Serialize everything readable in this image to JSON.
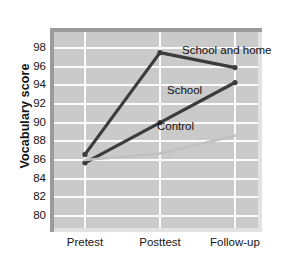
{
  "chart_data": {
    "type": "line",
    "title": "",
    "xlabel": "",
    "ylabel": "Vocabulary score",
    "categories": [
      "Pretest",
      "Posttest",
      "Follow-up"
    ],
    "ylim": [
      79,
      99
    ],
    "yticks": [
      98,
      96,
      94,
      92,
      90,
      88,
      86,
      84,
      82,
      80
    ],
    "grid": true,
    "legend_position": "inline-labels",
    "series": [
      {
        "name": "School and home",
        "values": [
          86.6,
          97.5,
          95.9
        ],
        "color": "#3c3c3c",
        "width": 3.2,
        "markers": true
      },
      {
        "name": "School",
        "values": [
          85.7,
          90.0,
          94.3
        ],
        "color": "#3c3c3c",
        "width": 3.2,
        "markers": true
      },
      {
        "name": "Control",
        "values": [
          86.0,
          86.7,
          88.6
        ],
        "color": "#c0c0c0",
        "width": 2.6,
        "markers": false
      }
    ],
    "annotations": [
      {
        "text": "School and home",
        "x": 182,
        "y": 44
      },
      {
        "text": "School",
        "x": 167,
        "y": 84
      },
      {
        "text": "Control",
        "x": 157,
        "y": 120
      }
    ]
  },
  "axes": {
    "y_title": "Vocabulary score",
    "y_tick_labels": [
      "98",
      "96",
      "94",
      "92",
      "90",
      "88",
      "86",
      "84",
      "82",
      "80"
    ],
    "x_tick_labels": [
      "Pretest",
      "Posttest",
      "Follow-up"
    ]
  },
  "style": {
    "panel_fill": "#cacaca",
    "grid_color": "#fcfcfc",
    "shadow_dark": "#9b9b9b",
    "shadow_light": "#e2e2e2",
    "text_color": "#151515",
    "dark_series_color": "#3c3c3c",
    "light_series_color": "#c0c0c0"
  }
}
